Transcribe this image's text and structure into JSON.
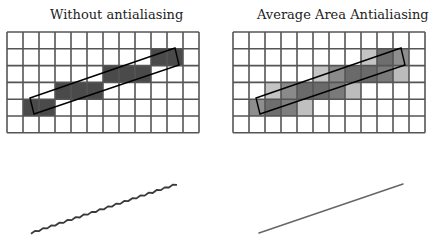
{
  "panels": [
    {
      "title": "Without antialiasing",
      "grid": {
        "cols": 12,
        "rows": 6,
        "origin_x": 7,
        "origin_y": 32,
        "cell_w": 16,
        "cell_h": 16.8
      },
      "cells": [
        {
          "row": 1,
          "col": 9,
          "shade": "#4a4a4a"
        },
        {
          "row": 1,
          "col": 10,
          "shade": "#4a4a4a"
        },
        {
          "row": 2,
          "col": 6,
          "shade": "#4a4a4a"
        },
        {
          "row": 2,
          "col": 7,
          "shade": "#4a4a4a"
        },
        {
          "row": 2,
          "col": 8,
          "shade": "#4a4a4a"
        },
        {
          "row": 3,
          "col": 3,
          "shade": "#4a4a4a"
        },
        {
          "row": 3,
          "col": 4,
          "shade": "#4a4a4a"
        },
        {
          "row": 3,
          "col": 5,
          "shade": "#4a4a4a"
        },
        {
          "row": 4,
          "col": 1,
          "shade": "#4a4a4a"
        },
        {
          "row": 4,
          "col": 2,
          "shade": "#4a4a4a"
        }
      ],
      "rectangle": [
        [
          30,
          98
        ],
        [
          175,
          48
        ],
        [
          179,
          65
        ],
        [
          34,
          114
        ]
      ],
      "sample_line": {
        "x1": 31,
        "y1": 233,
        "x2": 177,
        "y2": 184,
        "style": "jagged"
      }
    },
    {
      "title": "Average Area Antialiasing",
      "grid": {
        "cols": 12,
        "rows": 6,
        "origin_x": 233,
        "origin_y": 32,
        "cell_w": 16,
        "cell_h": 16.8
      },
      "cells": [
        {
          "row": 1,
          "col": 8,
          "shade": "#c4c4c4"
        },
        {
          "row": 1,
          "col": 9,
          "shade": "#6e6e6e"
        },
        {
          "row": 1,
          "col": 10,
          "shade": "#8e8e8e"
        },
        {
          "row": 2,
          "col": 5,
          "shade": "#c4c4c4"
        },
        {
          "row": 2,
          "col": 6,
          "shade": "#8a8a8a"
        },
        {
          "row": 2,
          "col": 7,
          "shade": "#6a6a6a"
        },
        {
          "row": 2,
          "col": 8,
          "shade": "#6a6a6a"
        },
        {
          "row": 2,
          "col": 9,
          "shade": "#7a7a7a"
        },
        {
          "row": 2,
          "col": 10,
          "shade": "#bcbcbc"
        },
        {
          "row": 3,
          "col": 2,
          "shade": "#c4c4c4"
        },
        {
          "row": 3,
          "col": 3,
          "shade": "#8a8a8a"
        },
        {
          "row": 3,
          "col": 4,
          "shade": "#6a6a6a"
        },
        {
          "row": 3,
          "col": 5,
          "shade": "#6a6a6a"
        },
        {
          "row": 3,
          "col": 6,
          "shade": "#7a7a7a"
        },
        {
          "row": 3,
          "col": 7,
          "shade": "#bcbcbc"
        },
        {
          "row": 4,
          "col": 1,
          "shade": "#8e8e8e"
        },
        {
          "row": 4,
          "col": 2,
          "shade": "#6e6e6e"
        },
        {
          "row": 4,
          "col": 3,
          "shade": "#7e7e7e"
        },
        {
          "row": 4,
          "col": 4,
          "shade": "#c0c0c0"
        }
      ],
      "rectangle": [
        [
          256,
          98
        ],
        [
          401,
          48
        ],
        [
          405,
          65
        ],
        [
          260,
          114
        ]
      ],
      "sample_line": {
        "x1": 259,
        "y1": 233,
        "x2": 403,
        "y2": 184,
        "style": "smooth"
      }
    }
  ],
  "colors": {
    "grid_line": "#555555",
    "rect_outline": "#000000",
    "line_color": "#555555",
    "background": "#ffffff"
  }
}
